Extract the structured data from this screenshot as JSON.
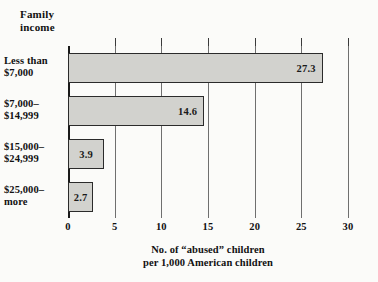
{
  "axis_title": "Family\nincome",
  "caption_line1": "No. of “abused” children",
  "caption_line2": "per 1,000 American children",
  "colors": {
    "bar_fill": "#d2d2ce",
    "bar_border": "#2b2b2b",
    "gridline": "#6f6f6f",
    "axis": "#1a1a1a",
    "background": "#fbfbf9",
    "text": "#111111"
  },
  "chart_data": {
    "type": "bar",
    "orientation": "horizontal",
    "title": "Family income",
    "xlabel": "No. of “abused” children per 1,000 American children",
    "ylabel": "Family income",
    "categories": [
      "Less than\n$7,000",
      "$7,000–\n$14,999",
      "$15,000–\n$24,999",
      "$25,000–\nmore"
    ],
    "values": [
      27.3,
      14.6,
      3.9,
      2.7
    ],
    "value_labels": [
      "27.3",
      "14.6",
      "3.9",
      "2.7"
    ],
    "xlim": [
      0,
      30
    ],
    "xticks": [
      0,
      5,
      10,
      15,
      20,
      25,
      30
    ],
    "xtick_labels": [
      "0",
      "5",
      "10",
      "15",
      "20",
      "25",
      "30"
    ],
    "grid": true,
    "grid_axis": "x",
    "legend": false
  }
}
